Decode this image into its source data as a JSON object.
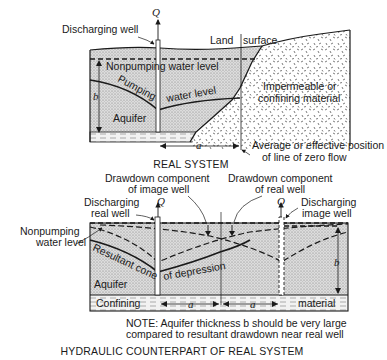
{
  "real_system": {
    "title": "REAL SYSTEM",
    "labels": {
      "discharging_well": "Discharging well",
      "q": "Q",
      "land_surface_1": "Land",
      "land_surface_2": "surface",
      "nonpumping_water_level": "Nonpumping water level",
      "pumping": "Pumping",
      "water_level": "water level",
      "b": "b",
      "aquifer": "Aquifer",
      "impermeable_1": "Impermeable or",
      "impermeable_2": "confining material",
      "a": "a",
      "zero_flow_1": "Average or effective position",
      "zero_flow_2": "of line of zero flow"
    }
  },
  "hydraulic_counterpart": {
    "title": "HYDRAULIC COUNTERPART OF REAL SYSTEM",
    "labels": {
      "drawdown_image_1": "Drawdown component",
      "drawdown_image_2": "of image well",
      "drawdown_real_1": "Drawdown component",
      "drawdown_real_2": "of real well",
      "discharging_real_1": "Discharging",
      "discharging_real_2": "real well",
      "discharging_image_1": "Discharging",
      "discharging_image_2": "image well",
      "q_real": "Q",
      "q_image": "Q",
      "nonpumping_1": "Nonpumping",
      "nonpumping_2": "water level",
      "resultant_cone": "Resultant cone",
      "of_depression": "of depression",
      "aquifer": "Aquifer",
      "confining": "Confining",
      "material": "material",
      "a_left": "a",
      "a_right": "a",
      "b": "b"
    },
    "note_1": "NOTE: Aquifer thickness b should be very large",
    "note_2": "compared to resultant drawdown near real well"
  },
  "colors": {
    "ink": "#1a1a1a",
    "aquifer_fill": "#d4d4d4",
    "confining_fill": "#eeeeee",
    "background": "#ffffff"
  }
}
